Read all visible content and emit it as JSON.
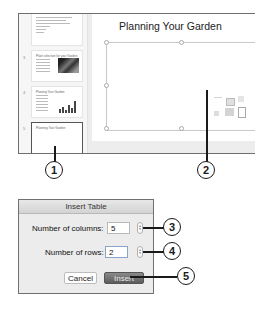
{
  "screenshot": {
    "slide_title": "Planning Your Garden",
    "thumbnails": [
      {
        "number": "",
        "title": "",
        "selected": false
      },
      {
        "number": "3",
        "title": "Plant selection for your Garden",
        "selected": false
      },
      {
        "number": "4",
        "title": "Planting Your Garden",
        "selected": false
      },
      {
        "number": "5",
        "title": "Planning Your Garden",
        "selected": true
      }
    ],
    "content_icons": [
      "insert-table-icon",
      "insert-chart-icon",
      "insert-smartart-icon",
      "insert-picture-icon",
      "insert-online-picture-icon",
      "insert-video-icon"
    ]
  },
  "callouts": {
    "c1": "1",
    "c2": "2",
    "c3": "3",
    "c4": "4",
    "c5": "5"
  },
  "dialog": {
    "title": "Insert Table",
    "columns_label": "Number of columns:",
    "columns_value": "5",
    "rows_label": "Number of rows:",
    "rows_value": "2",
    "cancel_label": "Cancel",
    "insert_label": "Insert",
    "stepper_up": "▲",
    "stepper_down": "▼"
  }
}
